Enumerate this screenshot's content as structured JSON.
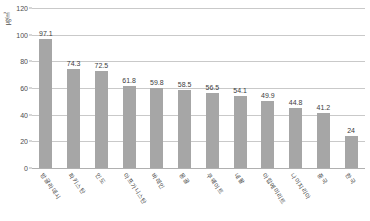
{
  "chart_data": {
    "type": "bar",
    "title": "",
    "xlabel": "",
    "ylabel": "㎍/㎥",
    "ylim": [
      0,
      120
    ],
    "yticks": [
      0,
      20,
      40,
      60,
      80,
      100,
      120
    ],
    "grid": true,
    "legend": "none",
    "orientation": "vertical",
    "bar_color": "#a6a6a6",
    "categories": [
      "방글라데시",
      "파키스탄",
      "인도",
      "아프가니스탄",
      "바레인",
      "몽골",
      "쿠웨이트",
      "네팔",
      "아랍에미리트",
      "나이지리아",
      "중국",
      "한국"
    ],
    "values": [
      97.1,
      74.3,
      72.5,
      61.8,
      59.8,
      58.5,
      56.5,
      54.1,
      49.9,
      44.8,
      41.2,
      24
    ],
    "value_labels": [
      "97.1",
      "74.3",
      "72.5",
      "61.8",
      "59.8",
      "58.5",
      "56.5",
      "54.1",
      "49.9",
      "44.8",
      "41.2",
      "24"
    ],
    "ytick_labels": [
      "0",
      "20",
      "40",
      "60",
      "80",
      "100",
      "120"
    ]
  },
  "axis": {
    "unit_label": "㎍/㎥"
  }
}
